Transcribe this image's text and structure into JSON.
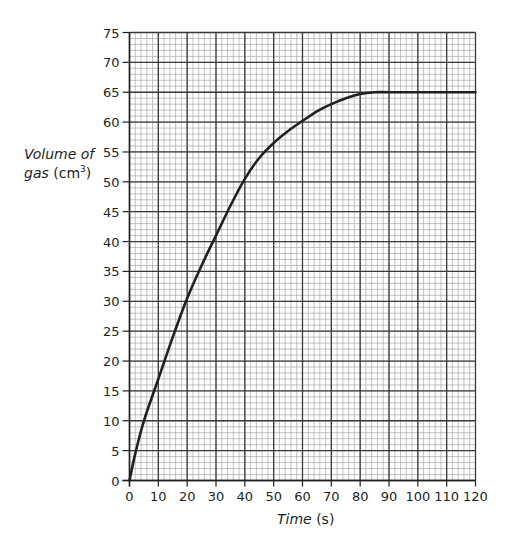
{
  "chart_data": {
    "type": "line",
    "title": "",
    "xlabel": "Time (s)",
    "ylabel": "Volume of gas (cm3)",
    "xlabel_parts": {
      "italic": "Time",
      "unit": " (s)"
    },
    "ylabel_parts": {
      "line1": "Volume of",
      "italic2": "gas",
      "unit_prefix": " (cm",
      "unit_sup": "3",
      "unit_suffix": ")"
    },
    "xlim": [
      0,
      120
    ],
    "ylim": [
      0,
      75
    ],
    "x_ticks": [
      0,
      10,
      20,
      30,
      40,
      50,
      60,
      70,
      80,
      90,
      100,
      110,
      120
    ],
    "y_ticks": [
      0,
      5,
      10,
      15,
      20,
      25,
      30,
      35,
      40,
      45,
      50,
      55,
      60,
      65,
      70,
      75
    ],
    "grid": {
      "on": true,
      "x_minor_step": 2,
      "y_minor_step": 1
    },
    "legend": null,
    "series": [
      {
        "name": "Volume of gas",
        "x": [
          0,
          2,
          5,
          10,
          15,
          20,
          25,
          30,
          35,
          40,
          45,
          50,
          55,
          60,
          65,
          70,
          75,
          80,
          85,
          90,
          100,
          110,
          120
        ],
        "y": [
          0,
          4.5,
          10,
          17,
          24,
          30.5,
          36,
          41,
          46,
          50.5,
          54,
          56.5,
          58.5,
          60.2,
          61.8,
          63,
          64,
          64.7,
          65,
          65,
          65,
          65,
          65
        ]
      }
    ],
    "colors": {
      "line": "#231f20",
      "grid_major": "#3a3a3a",
      "grid_minor": "#9a9a9a"
    }
  }
}
